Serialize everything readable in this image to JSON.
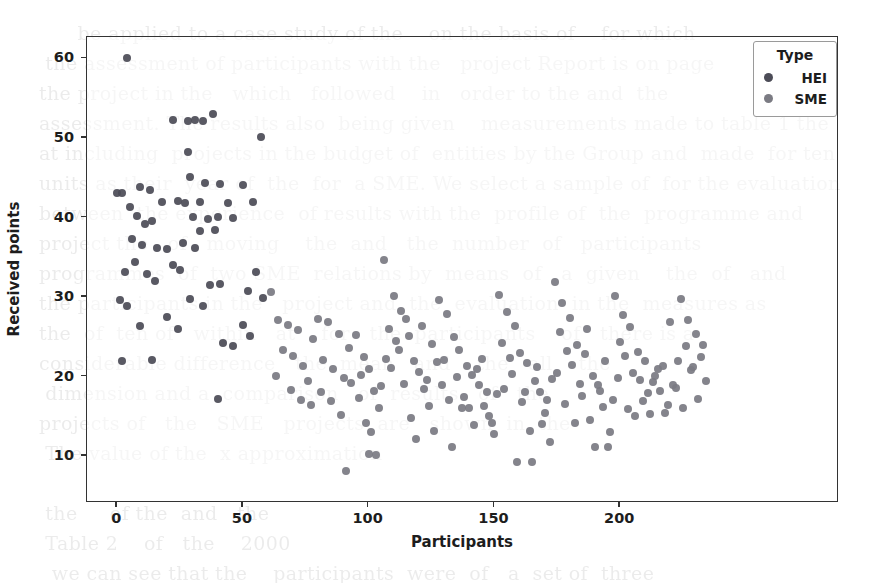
{
  "figure": {
    "background_color": "#ffffff",
    "frame_color": "#333333"
  },
  "legend": {
    "title": "Type",
    "position": "upper right",
    "entries": [
      {
        "label": "HEI",
        "color": "#4c4c57",
        "marker": "circle"
      },
      {
        "label": "SME",
        "color": "#7b7b83",
        "marker": "circle"
      }
    ]
  },
  "bleed_text": "        be applied to a case study of the    on the basis of    for which\n   the assessment of participants with the   project Report is on page\n  the project in the   which   followed    in   order to the and  the\n  assessment. The results also  being given    measurements made to table 1 the\n  at including  projects in the budget of  entities by the Group and  made  for ten\n  units as their  year of  the  for  a SME. We select a sample of  for the evaluation\n  between  the experience  of results with the  profile of  the  programme and\n  project the   of   moving    the  and   the  number  of   participants\n  programmes  of  two SME  relations by  means  of   a  given    the  of   and\n  the participants in the   project and  the  evaluation  in the  measures as\n  the  of  ten of   within   at    for   the  participants    of   there is a\n  considerable difference   the  mean   and    the   all    the\n   dimension and a  comparison   of  results   of   the\n  projects of   the   SME   projects  are   shown  in  the\n   The value of the  x approximation\n\n   the     of the  and   the\n   Table 2    of   the    2000\n    we can see that the    participants  were  of   a  set of  three",
  "chart_data": {
    "type": "scatter",
    "title": "",
    "xlabel": "Participants",
    "ylabel": "Received points",
    "xlim": [
      -12,
      287
    ],
    "ylim": [
      4.1,
      62.7
    ],
    "xticks": [
      0,
      50,
      100,
      150,
      200
    ],
    "yticks": [
      10,
      20,
      30,
      40,
      50,
      60
    ],
    "grid": false,
    "legend_position": "upper right",
    "series": [
      {
        "name": "HEI",
        "color": "#4c4c57",
        "points": [
          [
            4,
            60.1
          ],
          [
            0,
            43.1
          ],
          [
            2,
            43.1
          ],
          [
            9,
            43.9
          ],
          [
            13,
            43.4
          ],
          [
            18,
            42.0
          ],
          [
            5,
            41.3
          ],
          [
            8,
            40.2
          ],
          [
            11,
            39.2
          ],
          [
            14,
            39.6
          ],
          [
            6,
            37.3
          ],
          [
            10,
            36.5
          ],
          [
            16,
            36.2
          ],
          [
            20,
            36.0
          ],
          [
            3,
            33.2
          ],
          [
            7,
            34.4
          ],
          [
            12,
            32.9
          ],
          [
            15,
            32.0
          ],
          [
            1,
            29.6
          ],
          [
            4,
            28.9
          ],
          [
            9,
            26.3
          ],
          [
            2,
            22.0
          ],
          [
            22,
            52.2
          ],
          [
            28,
            52.1
          ],
          [
            31,
            52.2
          ],
          [
            34,
            52.1
          ],
          [
            38,
            53.0
          ],
          [
            28,
            48.2
          ],
          [
            29,
            45.1
          ],
          [
            35,
            44.3
          ],
          [
            41,
            44.2
          ],
          [
            24,
            42.1
          ],
          [
            27,
            41.8
          ],
          [
            33,
            42.0
          ],
          [
            44,
            41.8
          ],
          [
            30,
            40.1
          ],
          [
            36,
            39.8
          ],
          [
            40,
            40.1
          ],
          [
            46,
            40.0
          ],
          [
            33,
            38.3
          ],
          [
            39,
            38.4
          ],
          [
            26,
            36.8
          ],
          [
            31,
            36.2
          ],
          [
            22,
            34.0
          ],
          [
            25,
            33.4
          ],
          [
            37,
            31.5
          ],
          [
            41,
            31.6
          ],
          [
            29,
            29.7
          ],
          [
            34,
            28.9
          ],
          [
            20,
            27.5
          ],
          [
            24,
            26.0
          ],
          [
            42,
            24.2
          ],
          [
            46,
            23.8
          ],
          [
            50,
            44.1
          ],
          [
            54,
            42.0
          ],
          [
            57,
            50.1
          ],
          [
            55,
            33.2
          ],
          [
            52,
            30.8
          ],
          [
            58,
            29.9
          ],
          [
            50,
            26.5
          ],
          [
            53,
            25.1
          ],
          [
            40,
            17.2
          ],
          [
            14,
            22.1
          ]
        ]
      },
      {
        "name": "SME",
        "color": "#7b7b83",
        "points": [
          [
            61,
            30.6
          ],
          [
            64,
            27.1
          ],
          [
            68,
            26.5
          ],
          [
            72,
            25.9
          ],
          [
            66,
            23.4
          ],
          [
            70,
            22.6
          ],
          [
            74,
            21.3
          ],
          [
            63,
            20.1
          ],
          [
            76,
            19.4
          ],
          [
            78,
            24.7
          ],
          [
            80,
            27.3
          ],
          [
            84,
            26.8
          ],
          [
            88,
            25.4
          ],
          [
            82,
            22.1
          ],
          [
            86,
            20.9
          ],
          [
            90,
            19.8
          ],
          [
            92,
            23.6
          ],
          [
            95,
            25.2
          ],
          [
            98,
            22.4
          ],
          [
            100,
            21.0
          ],
          [
            102,
            18.2
          ],
          [
            96,
            17.3
          ],
          [
            104,
            16.1
          ],
          [
            91,
            8.1
          ],
          [
            106,
            34.6
          ],
          [
            110,
            30.1
          ],
          [
            113,
            28.2
          ],
          [
            108,
            26.0
          ],
          [
            116,
            25.1
          ],
          [
            112,
            23.3
          ],
          [
            118,
            22.0
          ],
          [
            120,
            20.6
          ],
          [
            114,
            19.1
          ],
          [
            122,
            18.4
          ],
          [
            124,
            16.3
          ],
          [
            117,
            14.8
          ],
          [
            126,
            13.2
          ],
          [
            100,
            10.2
          ],
          [
            103,
            10.1
          ],
          [
            128,
            29.6
          ],
          [
            131,
            27.9
          ],
          [
            134,
            25.0
          ],
          [
            136,
            23.4
          ],
          [
            130,
            22.1
          ],
          [
            139,
            21.3
          ],
          [
            141,
            20.2
          ],
          [
            144,
            19.0
          ],
          [
            138,
            17.4
          ],
          [
            146,
            16.3
          ],
          [
            148,
            15.1
          ],
          [
            142,
            13.9
          ],
          [
            150,
            12.8
          ],
          [
            133,
            11.1
          ],
          [
            152,
            30.3
          ],
          [
            155,
            28.1
          ],
          [
            158,
            26.4
          ],
          [
            153,
            24.2
          ],
          [
            160,
            23.0
          ],
          [
            163,
            21.7
          ],
          [
            157,
            20.3
          ],
          [
            166,
            19.4
          ],
          [
            168,
            18.1
          ],
          [
            161,
            16.8
          ],
          [
            170,
            15.4
          ],
          [
            164,
            13.2
          ],
          [
            172,
            11.8
          ],
          [
            159,
            9.2
          ],
          [
            165,
            9.3
          ],
          [
            174,
            31.9
          ],
          [
            177,
            29.2
          ],
          [
            180,
            27.4
          ],
          [
            176,
            25.6
          ],
          [
            183,
            24.0
          ],
          [
            186,
            22.8
          ],
          [
            181,
            21.4
          ],
          [
            189,
            20.1
          ],
          [
            191,
            19.0
          ],
          [
            185,
            17.6
          ],
          [
            193,
            16.2
          ],
          [
            188,
            14.6
          ],
          [
            196,
            13.0
          ],
          [
            190,
            11.2
          ],
          [
            195,
            11.1
          ],
          [
            198,
            30.1
          ],
          [
            201,
            27.8
          ],
          [
            204,
            26.2
          ],
          [
            200,
            24.4
          ],
          [
            207,
            23.1
          ],
          [
            210,
            21.9
          ],
          [
            205,
            20.5
          ],
          [
            213,
            19.3
          ],
          [
            216,
            18.2
          ],
          [
            209,
            16.9
          ],
          [
            218,
            15.4
          ],
          [
            212,
            15.3
          ],
          [
            221,
            19.0
          ],
          [
            215,
            21.0
          ],
          [
            224,
            29.8
          ],
          [
            227,
            27.1
          ],
          [
            230,
            25.3
          ],
          [
            226,
            23.8
          ],
          [
            232,
            22.4
          ],
          [
            228,
            20.8
          ],
          [
            234,
            19.4
          ],
          [
            222,
            18.6
          ],
          [
            231,
            17.2
          ],
          [
            225,
            16.0
          ],
          [
            229,
            21.2
          ],
          [
            233,
            24.0
          ],
          [
            220,
            26.9
          ],
          [
            223,
            22.0
          ],
          [
            107,
            22.2
          ],
          [
            109,
            21.1
          ],
          [
            111,
            24.5
          ],
          [
            115,
            27.2
          ],
          [
            121,
            26.4
          ],
          [
            125,
            24.1
          ],
          [
            129,
            18.9
          ],
          [
            132,
            17.0
          ],
          [
            135,
            20.0
          ],
          [
            137,
            16.0
          ],
          [
            140,
            16.1
          ],
          [
            143,
            21.0
          ],
          [
            145,
            22.2
          ],
          [
            147,
            18.0
          ],
          [
            149,
            14.2
          ],
          [
            151,
            17.8
          ],
          [
            154,
            18.4
          ],
          [
            156,
            22.3
          ],
          [
            162,
            18.0
          ],
          [
            167,
            21.2
          ],
          [
            169,
            14.0
          ],
          [
            171,
            17.1
          ],
          [
            173,
            19.7
          ],
          [
            175,
            20.4
          ],
          [
            178,
            16.5
          ],
          [
            179,
            23.2
          ],
          [
            182,
            14.1
          ],
          [
            184,
            19.1
          ],
          [
            187,
            26.0
          ],
          [
            192,
            18.2
          ],
          [
            194,
            22.0
          ],
          [
            197,
            17.0
          ],
          [
            199,
            19.8
          ],
          [
            202,
            22.6
          ],
          [
            203,
            15.9
          ],
          [
            206,
            15.1
          ],
          [
            208,
            19.6
          ],
          [
            211,
            17.9
          ],
          [
            214,
            20.1
          ],
          [
            217,
            21.3
          ],
          [
            219,
            16.4
          ],
          [
            69,
            18.3
          ],
          [
            73,
            17.0
          ],
          [
            77,
            16.4
          ],
          [
            81,
            18.0
          ],
          [
            85,
            16.9
          ],
          [
            89,
            15.2
          ],
          [
            93,
            19.2
          ],
          [
            97,
            20.2
          ],
          [
            99,
            14.1
          ],
          [
            101,
            13.0
          ],
          [
            105,
            18.8
          ],
          [
            119,
            12.1
          ],
          [
            123,
            19.6
          ],
          [
            127,
            21.8
          ]
        ]
      }
    ]
  }
}
